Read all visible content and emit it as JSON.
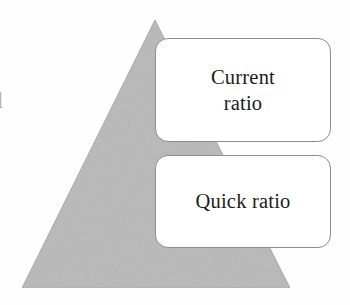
{
  "figure": {
    "type": "pyramid-diagram",
    "background_color": "#fefefe",
    "pyramid": {
      "name": "liquidity-pyramid",
      "fill_color": "#bdbdbd",
      "stroke_color": "#b0b0b0",
      "apex": {
        "x": 155,
        "y": 20
      },
      "base_left": {
        "x": 22,
        "y": 288
      },
      "base_right": {
        "x": 290,
        "y": 288
      }
    },
    "boxes": [
      {
        "id": "current-ratio",
        "label": "Current ratio",
        "line1": "Current",
        "line2": "ratio",
        "lines": 2,
        "x": 155,
        "y": 38,
        "width": 176,
        "height": 104,
        "fill_color": "#ffffff",
        "border_color": "#8d8d8d",
        "text_color": "#1b1b1b"
      },
      {
        "id": "quick-ratio",
        "label": "Quick ratio",
        "line1": "Quick ratio",
        "line2": "",
        "lines": 1,
        "x": 155,
        "y": 155,
        "width": 176,
        "height": 93,
        "fill_color": "#ffffff",
        "border_color": "#8d8d8d",
        "text_color": "#1b1b1b"
      }
    ],
    "edge_artifact": {
      "name": "cropped-margin-glyph",
      "text": "l",
      "color": "#b6b6b6"
    }
  }
}
